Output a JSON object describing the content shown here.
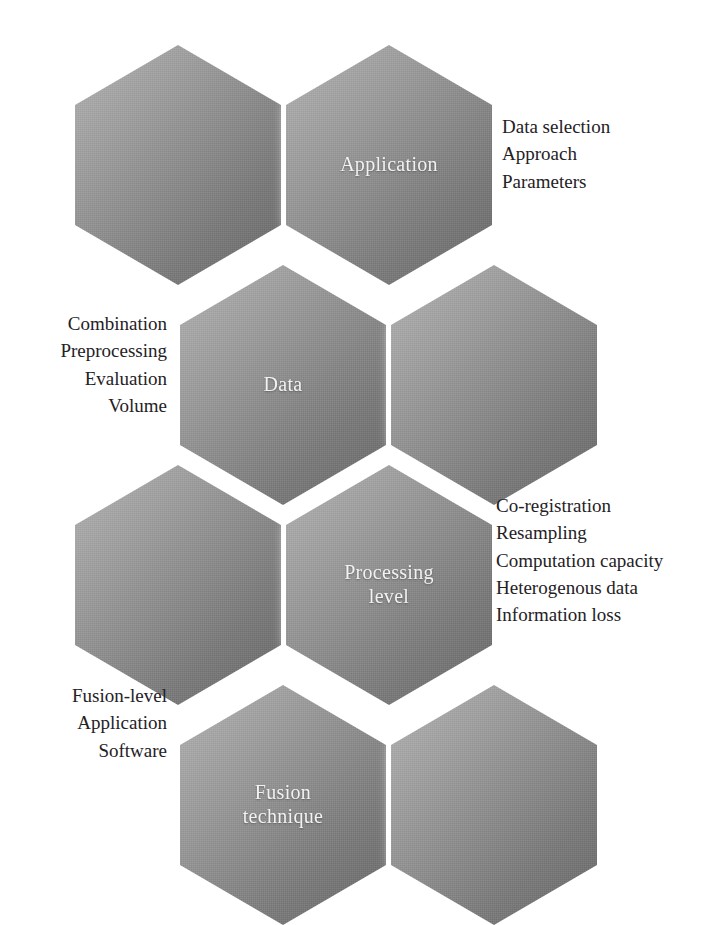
{
  "diagram": {
    "type": "honeycomb-hexagon-diagram",
    "background_color": "#ffffff",
    "hex_fill_light": "#b2b2b2",
    "hex_fill_dark": "#6b6b6b",
    "hex_label_color": "#f2f2f2",
    "note_text_color": "#24211f",
    "cells": [
      {
        "id": "cell-top-left",
        "label": "",
        "row": 1,
        "col": 1
      },
      {
        "id": "cell-application",
        "label": "Application",
        "row": 1,
        "col": 2
      },
      {
        "id": "cell-data",
        "label": "Data",
        "row": 2,
        "col": 1
      },
      {
        "id": "cell-row2-right",
        "label": "",
        "row": 2,
        "col": 2
      },
      {
        "id": "cell-row3-left",
        "label": "",
        "row": 3,
        "col": 1
      },
      {
        "id": "cell-processing",
        "label": "Processing\nlevel",
        "row": 3,
        "col": 2
      },
      {
        "id": "cell-fusion",
        "label": "Fusion\ntechnique",
        "row": 4,
        "col": 1
      },
      {
        "id": "cell-row4-right",
        "label": "",
        "row": 4,
        "col": 2
      }
    ],
    "notes": [
      {
        "id": "note-application",
        "side": "right",
        "attached_to": "Application",
        "lines": "Data selection\nApproach\nParameters",
        "items": [
          "Data selection",
          "Approach",
          "Parameters"
        ]
      },
      {
        "id": "note-data",
        "side": "left",
        "attached_to": "Data",
        "lines": "Combination\nPreprocessing\nEvaluation\nVolume",
        "items": [
          "Combination",
          "Preprocessing",
          "Evaluation",
          "Volume"
        ]
      },
      {
        "id": "note-processing",
        "side": "right",
        "attached_to": "Processing level",
        "lines": "Co-registration\nResampling\nComputation capacity\nHeterogenous data\nInformation loss",
        "items": [
          "Co-registration",
          "Resampling",
          "Computation capacity",
          "Heterogenous data",
          "Information loss"
        ]
      },
      {
        "id": "note-fusion",
        "side": "left",
        "attached_to": "Fusion technique",
        "lines": "Fusion-level\nApplication\nSoftware",
        "items": [
          "Fusion-level",
          "Application",
          "Software"
        ]
      }
    ]
  }
}
